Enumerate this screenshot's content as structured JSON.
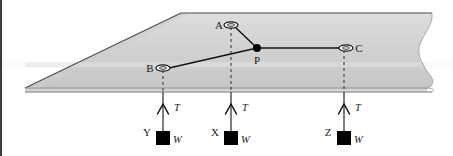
{
  "figure": {
    "background_color": "#ffffff",
    "left_border_color": "#3a3a3a",
    "plate": {
      "name": "inclined-plate",
      "fill_top": "#d9d9d9",
      "fill_shade": "#c9c9c9",
      "edge_color": "#9a9a9a",
      "outline_color": "#555555",
      "torn_right_edge": true
    },
    "nodes": [
      {
        "id": "A",
        "label": "A",
        "kind": "eyelet",
        "x": 231,
        "y": 25,
        "label_x": 219,
        "label_y": 28
      },
      {
        "id": "B",
        "label": "B",
        "kind": "eyelet",
        "x": 163,
        "y": 68,
        "label_x": 148,
        "label_y": 71
      },
      {
        "id": "C",
        "label": "C",
        "kind": "eyelet",
        "x": 344,
        "y": 48,
        "label_x": 357,
        "label_y": 51
      },
      {
        "id": "P",
        "label": "P",
        "kind": "knot",
        "x": 257,
        "y": 48,
        "label_x": 253,
        "label_y": 62
      }
    ],
    "cords": [
      {
        "name": "cord-A-P",
        "from": "A",
        "to": "P"
      },
      {
        "name": "cord-B-P",
        "from": "B",
        "to": "P"
      },
      {
        "name": "cord-P-C",
        "from": "P",
        "to": "C"
      }
    ],
    "drop_lines": [
      {
        "name": "drop-line-B",
        "x": 163,
        "y_top": 68,
        "y_bottom": 92
      },
      {
        "name": "drop-line-A",
        "x": 231,
        "y_top": 25,
        "y_bottom": 92
      },
      {
        "name": "drop-line-C",
        "x": 344,
        "y_top": 48,
        "y_bottom": 92
      }
    ],
    "hangers": [
      {
        "id": "Y",
        "weight_label": "Y",
        "tension_label": "T",
        "load_label": "W",
        "x": 163,
        "cord_top_y": 96,
        "block_y": 131,
        "label_x": 149,
        "label_y": 136,
        "tension_label_x": 172,
        "tension_label_y": 110,
        "load_label_x": 176,
        "load_label_y": 141
      },
      {
        "id": "X",
        "weight_label": "X",
        "tension_label": "T",
        "load_label": "W",
        "x": 231,
        "cord_top_y": 96,
        "block_y": 131,
        "label_x": 217,
        "label_y": 136,
        "tension_label_x": 240,
        "tension_label_y": 110,
        "load_label_x": 244,
        "load_label_y": 141
      },
      {
        "id": "Z",
        "weight_label": "Z",
        "tension_label": "T",
        "load_label": "W",
        "x": 344,
        "cord_top_y": 96,
        "block_y": 131,
        "label_x": 330,
        "label_y": 136,
        "tension_label_x": 353,
        "tension_label_y": 110,
        "load_label_x": 357,
        "load_label_y": 141
      }
    ],
    "labels": {
      "A": "A",
      "B": "B",
      "C": "C",
      "P": "P",
      "X": "X",
      "Y": "Y",
      "Z": "Z",
      "T": "T",
      "W": "W"
    },
    "colors": {
      "line": "#1a1a1a",
      "block_fill": "#000000",
      "dash": "#333333",
      "plate_light": "#dedede",
      "plate_mid": "#cfcfcf",
      "plate_dark": "#bdbdbd"
    }
  }
}
